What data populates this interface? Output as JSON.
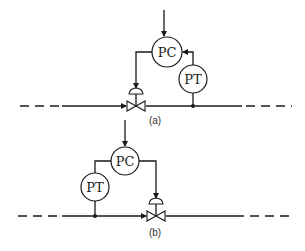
{
  "diagram": {
    "a": {
      "controller_label": "PC",
      "transmitter_label": "PT",
      "caption": "(a)",
      "description": "Pressure transmitter downstream of control valve (feedback from downstream)"
    },
    "b": {
      "controller_label": "PC",
      "transmitter_label": "PT",
      "caption": "(b)",
      "description": "Pressure transmitter upstream of control valve"
    },
    "colors": {
      "line": "#1a1a1a",
      "background": "#ffffff"
    }
  }
}
